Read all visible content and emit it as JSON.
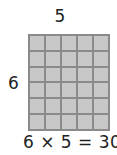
{
  "diagram": {
    "columns_label": "5",
    "rows_label": "6",
    "rows": 6,
    "columns": 5,
    "equation": "6 × 5 = 30",
    "colors": {
      "cell_fill": "#c8c8c8",
      "grid_line": "#8a8a8a"
    }
  }
}
